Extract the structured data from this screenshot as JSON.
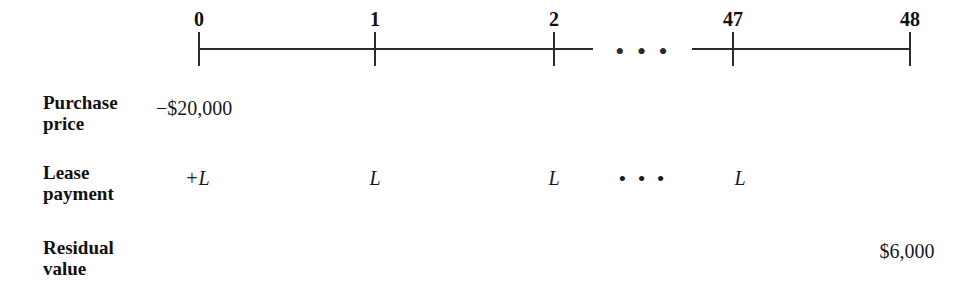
{
  "figure": {
    "type": "cash-flow-timeline",
    "width": 979,
    "height": 298,
    "background_color": "#ffffff",
    "line_color": "#2b2b2b",
    "text_color": "#1a1a1a"
  },
  "timeline": {
    "axis_y": 48,
    "segments": [
      {
        "name": "segment-0-to-2",
        "x_start": 199,
        "x_end": 593
      },
      {
        "name": "segment-47-to-48",
        "x_start": 692,
        "x_end": 910
      }
    ],
    "ticks": [
      {
        "label": "0",
        "x": 199
      },
      {
        "label": "1",
        "x": 375
      },
      {
        "label": "2",
        "x": 554
      },
      {
        "label": "47",
        "x": 733
      },
      {
        "label": "48",
        "x": 910
      }
    ],
    "break_ellipsis": {
      "label": "• • •",
      "x": 643
    }
  },
  "rows": [
    {
      "name": "purchase-price",
      "label": "Purchase\nprice",
      "label_x": 43,
      "label_y": 92,
      "entries": [
        {
          "name": "purchase-price-value",
          "text": "−$20,000",
          "x": 156,
          "y": 98,
          "align": "left",
          "italic": false
        }
      ]
    },
    {
      "name": "lease-payment",
      "label": "Lease\npayment",
      "label_x": 43,
      "label_y": 162,
      "entries": [
        {
          "name": "lease-payment-period-0",
          "text": "+L",
          "x": 185,
          "y": 168,
          "align": "left",
          "italic": true
        },
        {
          "name": "lease-payment-period-1",
          "text": "L",
          "x": 375,
          "y": 168,
          "align": "center",
          "italic": true
        },
        {
          "name": "lease-payment-period-2",
          "text": "L",
          "x": 554,
          "y": 168,
          "align": "center",
          "italic": true
        },
        {
          "name": "lease-payment-ellipsis",
          "text": "• • •",
          "x": 643,
          "y": 168,
          "align": "center",
          "italic": false,
          "ellipsis": true
        },
        {
          "name": "lease-payment-period-47",
          "text": "L",
          "x": 740,
          "y": 168,
          "align": "center",
          "italic": true
        }
      ]
    },
    {
      "name": "residual-value",
      "label": "Residual\nvalue",
      "label_x": 43,
      "label_y": 237,
      "entries": [
        {
          "name": "residual-value-amount",
          "text": "$6,000",
          "x": 907,
          "y": 241,
          "align": "center",
          "italic": false
        }
      ]
    }
  ],
  "chart_data": {
    "type": "table",
    "xlabel": "Period (months)",
    "categories": [
      "0",
      "1",
      "2",
      "…",
      "47",
      "48"
    ],
    "series": [
      {
        "name": "Purchase price",
        "values": [
          "−$20,000",
          "",
          "",
          "",
          "",
          ""
        ]
      },
      {
        "name": "Lease payment",
        "values": [
          "+L",
          "L",
          "L",
          "…",
          "L",
          ""
        ]
      },
      {
        "name": "Residual value",
        "values": [
          "",
          "",
          "",
          "",
          "",
          "$6,000"
        ]
      }
    ]
  }
}
